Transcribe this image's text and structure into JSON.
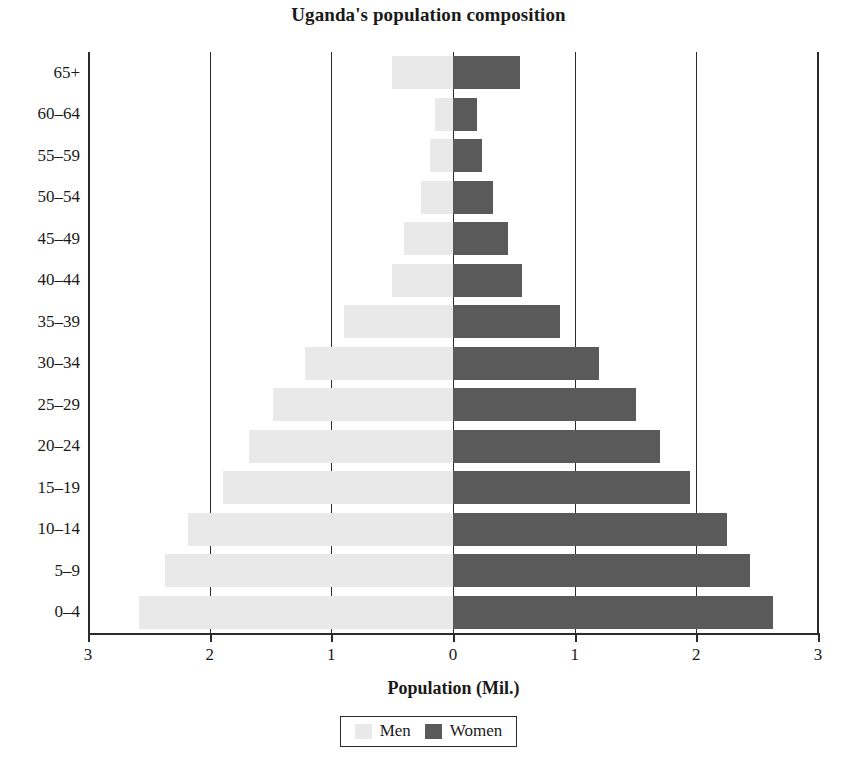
{
  "chart_data": {
    "type": "bar",
    "subtype": "population-pyramid",
    "title": "Uganda's population composition",
    "xlabel": "Population (Mil.)",
    "ylabel": "",
    "xlim": [
      -3,
      3
    ],
    "xticks": [
      3,
      2,
      1,
      0,
      1,
      2,
      3
    ],
    "xtick_labels": [
      "3",
      "2",
      "1",
      "0",
      "1",
      "2",
      "3"
    ],
    "grid": true,
    "legend_position": "bottom",
    "categories": [
      "0–4",
      "5–9",
      "10–14",
      "15–19",
      "20–24",
      "25–29",
      "30–34",
      "35–39",
      "40–44",
      "45–49",
      "50–54",
      "55–59",
      "60–64",
      "65+"
    ],
    "series": [
      {
        "name": "Men",
        "color": "#e9e9e9",
        "side": "left",
        "values": [
          2.58,
          2.37,
          2.18,
          1.89,
          1.68,
          1.48,
          1.22,
          0.9,
          0.5,
          0.4,
          0.26,
          0.19,
          0.15,
          0.5
        ]
      },
      {
        "name": "Women",
        "color": "#5a5a5a",
        "side": "right",
        "values": [
          2.63,
          2.44,
          2.25,
          1.95,
          1.7,
          1.5,
          1.2,
          0.88,
          0.57,
          0.45,
          0.33,
          0.24,
          0.2,
          0.55
        ]
      }
    ]
  },
  "axis": {
    "y_labels_top_to_bottom": [
      "65+",
      "60–64",
      "55–59",
      "50–54",
      "45–49",
      "40–44",
      "35–39",
      "30–34",
      "25–29",
      "20–24",
      "15–19",
      "10–14",
      "5–9",
      "0–4"
    ],
    "x_labels_left_to_right": [
      "3",
      "2",
      "1",
      "0",
      "1",
      "2",
      "3"
    ],
    "x_title": "Population (Mil.)"
  },
  "legend": {
    "entries": [
      {
        "label": "Men",
        "color": "#e9e9e9"
      },
      {
        "label": "Women",
        "color": "#5a5a5a"
      }
    ]
  },
  "colors": {
    "men": "#e9e9e9",
    "women": "#5a5a5a",
    "axis": "#2b2b2b",
    "text": "#1a1a1a",
    "background": "#ffffff"
  }
}
